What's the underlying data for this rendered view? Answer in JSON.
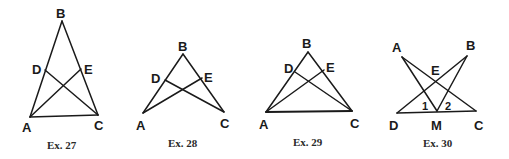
{
  "figures": [
    {
      "caption": "Ex. 27",
      "labels": {
        "A": "A",
        "B": "B",
        "C": "C",
        "D": "D",
        "E": "E"
      },
      "points": {
        "A": [
          30,
          117
        ],
        "B": [
          62,
          21
        ],
        "C": [
          98,
          115
        ],
        "D": [
          45,
          70
        ],
        "E": [
          81,
          69
        ]
      },
      "segments": [
        [
          "A",
          "B"
        ],
        [
          "B",
          "C"
        ],
        [
          "A",
          "C"
        ],
        [
          "A",
          "E"
        ],
        [
          "C",
          "D"
        ]
      ]
    },
    {
      "caption": "Ex. 28",
      "labels": {
        "A": "A",
        "B": "B",
        "C": "C",
        "D": "D",
        "E": "E"
      },
      "points": {
        "A": [
          143,
          113
        ],
        "B": [
          183,
          54
        ],
        "C": [
          224,
          112
        ],
        "D": [
          165,
          80
        ],
        "E": [
          202,
          78
        ]
      },
      "segments": [
        [
          "A",
          "B"
        ],
        [
          "B",
          "C"
        ],
        [
          "A",
          "E"
        ],
        [
          "C",
          "D"
        ]
      ]
    },
    {
      "caption": "Ex. 29",
      "labels": {
        "A": "A",
        "B": "B",
        "C": "C",
        "D": "D",
        "E": "E"
      },
      "points": {
        "A": [
          266,
          112
        ],
        "B": [
          308,
          52
        ],
        "C": [
          352,
          111
        ],
        "D": [
          295,
          72
        ],
        "E": [
          324,
          70
        ]
      },
      "segments": [
        [
          "A",
          "B"
        ],
        [
          "B",
          "C"
        ],
        [
          "A",
          "C"
        ],
        [
          "A",
          "E"
        ],
        [
          "C",
          "D"
        ]
      ]
    },
    {
      "caption": "Ex. 30",
      "labels": {
        "A": "A",
        "B": "B",
        "C": "C",
        "D": "D",
        "E": "E",
        "M": "M",
        "angle1": "1",
        "angle2": "2"
      },
      "points": {
        "A": [
          402,
          57
        ],
        "B": [
          467,
          56
        ],
        "C": [
          476,
          111
        ],
        "D": [
          397,
          113
        ],
        "M": [
          437,
          111
        ],
        "E": [
          436,
          80
        ]
      },
      "segments": [
        [
          "D",
          "C"
        ],
        [
          "A",
          "M"
        ],
        [
          "A",
          "C"
        ],
        [
          "B",
          "M"
        ],
        [
          "B",
          "D"
        ]
      ]
    }
  ]
}
